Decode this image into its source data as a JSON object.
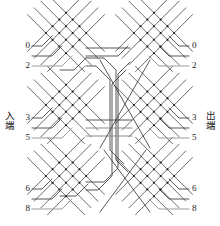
{
  "diagram": {
    "type": "three-stage-switching-network",
    "side_labels": {
      "input": {
        "chars": [
          "入",
          "端"
        ],
        "text": "入端"
      },
      "output": {
        "chars": [
          "出",
          "端"
        ],
        "text": "出端"
      }
    },
    "colors": {
      "line": "#3a3a3a",
      "line_light": "#8c8c8c",
      "node": "#1a1a1a",
      "background": "#ffffff",
      "text": "#1a1a1a"
    },
    "input_port_labels": [
      "0",
      "2",
      "3",
      "5",
      "6",
      "8"
    ],
    "output_port_labels": [
      "0",
      "2",
      "3",
      "5",
      "6",
      "8"
    ],
    "blocks": [
      {
        "name": "top-left-crossbar",
        "stage": "input",
        "group": 1
      },
      {
        "name": "top-right-crossbar",
        "stage": "output",
        "group": 1
      },
      {
        "name": "middle-left-crossbar",
        "stage": "input",
        "group": 2
      },
      {
        "name": "middle-right-crossbar",
        "stage": "output",
        "group": 2
      },
      {
        "name": "bottom-left-crossbar",
        "stage": "input",
        "group": 3
      },
      {
        "name": "bottom-right-crossbar",
        "stage": "output",
        "group": 3
      }
    ],
    "port_rows": [
      {
        "label": "0",
        "y": 46,
        "side": "both"
      },
      {
        "label": "",
        "y": 56,
        "side": "both"
      },
      {
        "label": "2",
        "y": 66,
        "side": "both"
      },
      {
        "label": "3",
        "y": 118,
        "side": "both"
      },
      {
        "label": "",
        "y": 128,
        "side": "both"
      },
      {
        "label": "5",
        "y": 138,
        "side": "both"
      },
      {
        "label": "6",
        "y": 189,
        "side": "both"
      },
      {
        "label": "",
        "y": 199,
        "side": "both"
      },
      {
        "label": "8",
        "y": 209,
        "side": "both"
      }
    ]
  }
}
